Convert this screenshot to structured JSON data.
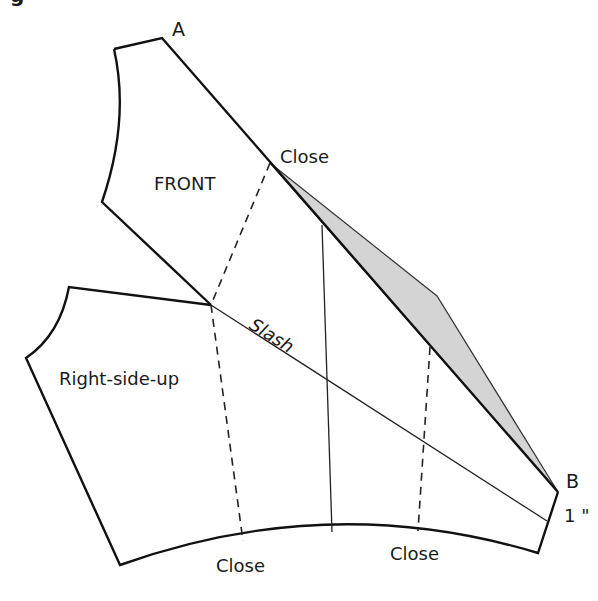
{
  "figure": {
    "title_fragment": "g",
    "labels": {
      "point_a": "A",
      "point_b": "B",
      "front": "FRONT",
      "right_side_up": "Right-side-up",
      "close_top": "Close",
      "slash": "Slash",
      "close_bottom_left": "Close",
      "close_bottom_right": "Close",
      "measure": "1 \""
    },
    "colors": {
      "line": "#111111",
      "shade_fill": "#d4d4d4",
      "background": "#ffffff"
    }
  }
}
